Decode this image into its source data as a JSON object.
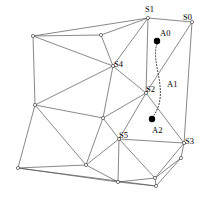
{
  "figure": {
    "width": 207,
    "height": 199,
    "background_color": "#ffffff",
    "edge_color": "#555555",
    "vertex_fill_color": "#ffffff",
    "agent_dot_color": "#000000",
    "path_color": "#222222"
  },
  "labels": {
    "s0": "S0",
    "s1": "S1",
    "s2": "S2",
    "s3": "S3",
    "s4": "S4",
    "s5": "S5",
    "a0": "A0",
    "a1": "A1",
    "a2": "A2"
  },
  "label_positions": {
    "s0": {
      "x": 183,
      "y": 13
    },
    "s1": {
      "x": 145,
      "y": 5
    },
    "s2": {
      "x": 146,
      "y": 85
    },
    "s3": {
      "x": 185,
      "y": 137
    },
    "s4": {
      "x": 114,
      "y": 60
    },
    "s5": {
      "x": 119,
      "y": 131
    },
    "a0": {
      "x": 160,
      "y": 29
    },
    "a1": {
      "x": 167,
      "y": 80
    },
    "a2": {
      "x": 152,
      "y": 126
    }
  },
  "named_vertices": {
    "s0": {
      "x": 192,
      "y": 22
    },
    "s1": {
      "x": 148,
      "y": 18
    },
    "s2": {
      "x": 146,
      "y": 93
    },
    "s3": {
      "x": 184,
      "y": 143
    },
    "s4": {
      "x": 113,
      "y": 66
    },
    "s5": {
      "x": 119,
      "y": 139
    }
  },
  "unnamed_vertices": [
    {
      "x": 33,
      "y": 36
    },
    {
      "x": 101,
      "y": 35
    },
    {
      "x": 35,
      "y": 105
    },
    {
      "x": 103,
      "y": 118
    },
    {
      "x": 18,
      "y": 168
    },
    {
      "x": 86,
      "y": 165
    },
    {
      "x": 118,
      "y": 182
    },
    {
      "x": 155,
      "y": 178
    },
    {
      "x": 181,
      "y": 158
    },
    {
      "x": 156,
      "y": 186
    }
  ],
  "agent_dots": [
    {
      "x": 157,
      "y": 41,
      "r": 3.2
    },
    {
      "x": 152,
      "y": 119,
      "r": 3.2
    }
  ],
  "path_arc": {
    "start": {
      "x": 157,
      "y": 44
    },
    "control1": {
      "x": 150,
      "y": 62
    },
    "control2": {
      "x": 170,
      "y": 92
    },
    "end": {
      "x": 154,
      "y": 115
    }
  },
  "edges": [
    [
      33,
      36,
      101,
      35
    ],
    [
      101,
      35,
      148,
      18
    ],
    [
      33,
      36,
      148,
      18
    ],
    [
      33,
      36,
      113,
      66
    ],
    [
      101,
      35,
      113,
      66
    ],
    [
      148,
      18,
      113,
      66
    ],
    [
      33,
      36,
      35,
      105
    ],
    [
      35,
      105,
      113,
      66
    ],
    [
      113,
      66,
      146,
      93
    ],
    [
      148,
      18,
      146,
      93
    ],
    [
      148,
      18,
      192,
      22
    ],
    [
      192,
      22,
      146,
      93
    ],
    [
      192,
      22,
      184,
      143
    ],
    [
      146,
      93,
      184,
      143
    ],
    [
      35,
      105,
      103,
      118
    ],
    [
      113,
      66,
      103,
      118
    ],
    [
      103,
      118,
      146,
      93
    ],
    [
      103,
      118,
      119,
      139
    ],
    [
      146,
      93,
      119,
      139
    ],
    [
      119,
      139,
      184,
      143
    ],
    [
      35,
      105,
      18,
      168
    ],
    [
      35,
      105,
      86,
      165
    ],
    [
      18,
      168,
      86,
      165
    ],
    [
      103,
      118,
      86,
      165
    ],
    [
      86,
      165,
      119,
      139
    ],
    [
      18,
      168,
      118,
      182
    ],
    [
      86,
      165,
      118,
      182
    ],
    [
      119,
      139,
      118,
      182
    ],
    [
      119,
      139,
      155,
      178
    ],
    [
      118,
      182,
      155,
      178
    ],
    [
      155,
      178,
      184,
      143
    ],
    [
      184,
      143,
      181,
      158
    ],
    [
      155,
      178,
      181,
      158
    ],
    [
      118,
      182,
      156,
      186
    ],
    [
      155,
      178,
      156,
      186
    ],
    [
      18,
      168,
      156,
      186
    ],
    [
      181,
      158,
      156,
      186
    ]
  ]
}
